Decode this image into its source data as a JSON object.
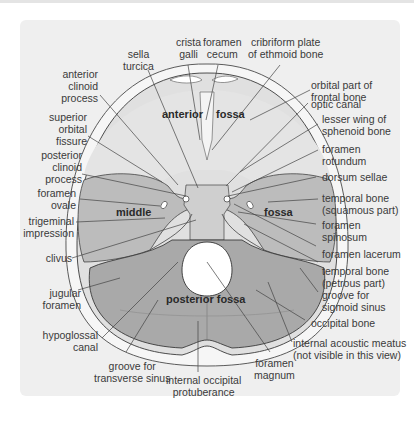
{
  "colors": {
    "page_background": "#ffffff",
    "panel_background": "#efefef",
    "skull_outer": "#f5f5f5",
    "anterior_fossa": "#dcdcdc",
    "middle_fossa": "#b9b9b9",
    "posterior_fossa": "#a8a8a8",
    "foramen_magnum": "#ffffff",
    "leader_line": "#444444",
    "text": "#3a3a3a"
  },
  "regions": {
    "anterior": "anterior",
    "anterior_fossa": "fossa",
    "middle": "middle",
    "middle_fossa": "fossa",
    "posterior": "posterior fossa"
  },
  "labels": {
    "crista_galli": "crista\ngalli",
    "foramen_cecum": "foramen\ncecum",
    "cribriform_plate": "cribriform plate\nof ethmoid bone",
    "sella_turcica": "sella\nturcica",
    "anterior_clinoid_process": "anterior\nclinoid\nprocess",
    "orbital_part_frontal_bone": "orbital part of\nfrontal bone",
    "optic_canal": "optic canal",
    "superior_orbital_fissure": "superior\norbital\nfissure",
    "lesser_wing_sphenoid": "lesser wing of\nsphenoid bone",
    "posterior_clinoid_process": "posterior\nclinoid\nprocess",
    "foramen_rotundum": "foramen\nrotundum",
    "dorsum_sellae": "dorsum sellae",
    "foramen_ovale": "foramen\novale",
    "temporal_bone_squamous": "temporal bone\n(squamous part)",
    "trigeminal_impression": "trigeminal\nimpression",
    "foramen_spinosum": "foramen\nspinosum",
    "clivus": "clivus",
    "foramen_lacerum": "foramen lacerum",
    "temporal_bone_petrous": "temporal bone\n(petrous part)",
    "jugular_foramen": "jugular\nforamen",
    "groove_sigmoid_sinus": "groove for\nsigmoid sinus",
    "occipital_bone": "occipital bone",
    "hypoglossal_canal": "hypoglossal\ncanal",
    "internal_acoustic_meatus": "internal acoustic meatus\n(not visible in this view)",
    "groove_transverse_sinus": "groove for\ntransverse sinus",
    "foramen_magnum": "foramen\nmagnum",
    "internal_occipital_protuberance": "internal occipital\nprotuberance"
  }
}
